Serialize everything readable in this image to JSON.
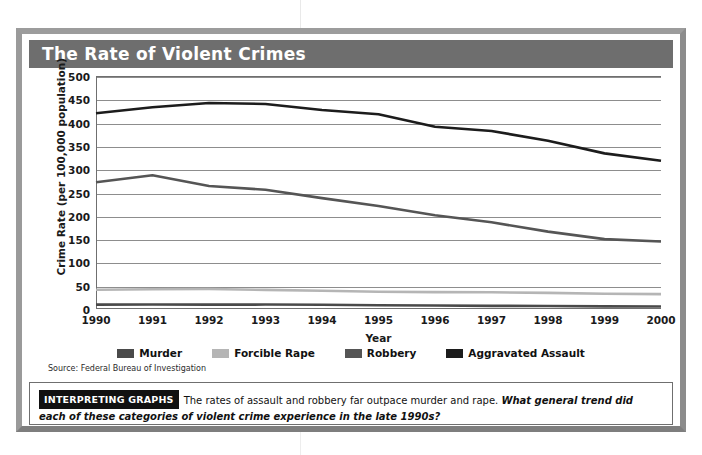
{
  "figure": {
    "title": "The Rate of Violent Crimes",
    "source": "Source: Federal Bureau of Investigation",
    "caption": {
      "badge": "INTERPRETING GRAPHS",
      "plain": "The rates of assault and robbery far outpace murder and rape.",
      "emphasis": "What general trend did each of these categories of violent crime experience in the late 1990s?"
    }
  },
  "colors": {
    "title_bar": "#6e6e6e",
    "frame": "#9c9c9c",
    "grid": "#8d8d8d",
    "axis": "#6f6f6f",
    "murder": "#4a4a4a",
    "forcible_rape": "#b5b5b5",
    "robbery": "#555555",
    "aggravated_assault": "#1c1c1c"
  },
  "chart_data": {
    "type": "line",
    "title": "The Rate of Violent Crimes",
    "xlabel": "Year",
    "ylabel": "Crime Rate (per 100,000 population)",
    "x": [
      1990,
      1991,
      1992,
      1993,
      1994,
      1995,
      1996,
      1997,
      1998,
      1999,
      2000
    ],
    "xtick_labels": [
      "1990",
      "1991",
      "1992",
      "1993",
      "1994",
      "1995",
      "1996",
      "1997",
      "1998",
      "1999",
      "2000"
    ],
    "ytick_labels": [
      "500",
      "450",
      "400",
      "350",
      "300",
      "250",
      "200",
      "150",
      "100",
      "50",
      "0"
    ],
    "yticks": [
      500,
      450,
      400,
      350,
      300,
      250,
      200,
      150,
      100,
      50,
      0
    ],
    "ylim": [
      0,
      500
    ],
    "xlim": [
      1990,
      2000
    ],
    "grid": "horizontal",
    "legend_position": "bottom",
    "series": [
      {
        "name": "Murder",
        "color": "#4a4a4a",
        "values": [
          9.4,
          9.8,
          9.3,
          9.5,
          9.0,
          8.2,
          7.4,
          6.8,
          6.3,
          5.7,
          5.5
        ]
      },
      {
        "name": "Forcible Rape",
        "color": "#b5b5b5",
        "values": [
          41.2,
          42.3,
          42.8,
          41.1,
          39.3,
          37.1,
          36.3,
          35.9,
          34.5,
          32.8,
          32.0
        ]
      },
      {
        "name": "Robbery",
        "color": "#555555",
        "values": [
          272,
          287,
          264,
          256,
          238,
          221,
          201,
          186,
          166,
          150,
          145
        ]
      },
      {
        "name": "Aggravated Assault",
        "color": "#1c1c1c",
        "values": [
          420,
          433,
          442,
          440,
          427,
          418,
          391,
          382,
          361,
          334,
          318
        ]
      }
    ]
  }
}
